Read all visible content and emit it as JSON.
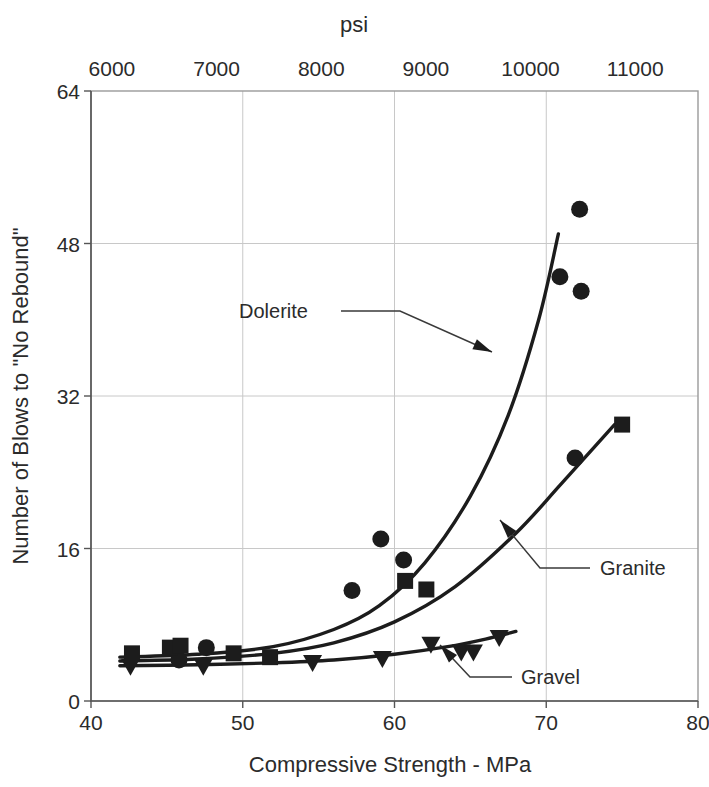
{
  "chart_data": {
    "type": "scatter",
    "title": "",
    "xlabel": "Compressive Strength - MPa",
    "ylabel": "Number of Blows to \"No Rebound\"",
    "top_axis_label": "psi",
    "xlim": [
      40,
      80
    ],
    "ylim": [
      0,
      64
    ],
    "top_xlim": [
      5800,
      11600
    ],
    "xticks": [
      40,
      50,
      60,
      70,
      80
    ],
    "xticklabels": [
      "40",
      "50",
      "60",
      "70",
      "80"
    ],
    "yticks": [
      0,
      16,
      32,
      48,
      64
    ],
    "yticklabels": [
      "0",
      "16",
      "32",
      "48",
      "64"
    ],
    "top_xticks": [
      6000,
      7000,
      8000,
      9000,
      10000,
      11000
    ],
    "top_xticklabels": [
      "6000",
      "7000",
      "8000",
      "9000",
      "10000",
      "11000"
    ],
    "grid": true,
    "legend_position": "inline-annotations",
    "series": [
      {
        "name": "Dolerite",
        "marker": "circle",
        "color": "#1c1c1c",
        "points": [
          {
            "x": 47.6,
            "y": 5.6
          },
          {
            "x": 45.8,
            "y": 4.3
          },
          {
            "x": 59.1,
            "y": 17.0
          },
          {
            "x": 57.2,
            "y": 11.6
          },
          {
            "x": 60.6,
            "y": 14.8
          },
          {
            "x": 70.9,
            "y": 44.5
          },
          {
            "x": 72.2,
            "y": 51.6
          },
          {
            "x": 72.3,
            "y": 43.0
          },
          {
            "x": 71.9,
            "y": 25.5
          }
        ]
      },
      {
        "name": "Granite",
        "marker": "square",
        "color": "#1c1c1c",
        "points": [
          {
            "x": 42.7,
            "y": 5.0
          },
          {
            "x": 45.2,
            "y": 5.6
          },
          {
            "x": 45.9,
            "y": 5.8
          },
          {
            "x": 49.4,
            "y": 5.0
          },
          {
            "x": 51.8,
            "y": 4.6
          },
          {
            "x": 60.7,
            "y": 12.6
          },
          {
            "x": 62.1,
            "y": 11.7
          },
          {
            "x": 75.0,
            "y": 29.0
          }
        ]
      },
      {
        "name": "Gravel",
        "marker": "triangle-down",
        "color": "#1c1c1c",
        "points": [
          {
            "x": 42.6,
            "y": 3.6
          },
          {
            "x": 47.4,
            "y": 3.6
          },
          {
            "x": 54.6,
            "y": 4.0
          },
          {
            "x": 59.2,
            "y": 4.4
          },
          {
            "x": 62.4,
            "y": 5.9
          },
          {
            "x": 64.4,
            "y": 5.1
          },
          {
            "x": 65.2,
            "y": 5.1
          },
          {
            "x": 66.9,
            "y": 6.6
          }
        ]
      }
    ],
    "trend_curves": [
      {
        "name": "Dolerite",
        "points": [
          [
            41.9,
            4.6
          ],
          [
            47.0,
            4.9
          ],
          [
            52.0,
            5.7
          ],
          [
            56.0,
            7.5
          ],
          [
            59.0,
            10.0
          ],
          [
            62.0,
            14.5
          ],
          [
            65.0,
            21.5
          ],
          [
            67.5,
            30.0
          ],
          [
            69.5,
            40.0
          ],
          [
            70.8,
            49.0
          ]
        ]
      },
      {
        "name": "Granite",
        "points": [
          [
            41.9,
            4.2
          ],
          [
            47.0,
            4.4
          ],
          [
            52.0,
            5.0
          ],
          [
            56.0,
            6.1
          ],
          [
            60.0,
            8.3
          ],
          [
            64.0,
            12.0
          ],
          [
            68.0,
            17.6
          ],
          [
            71.0,
            22.8
          ],
          [
            74.5,
            29.0
          ]
        ]
      },
      {
        "name": "Gravel",
        "points": [
          [
            41.9,
            3.7
          ],
          [
            47.0,
            3.8
          ],
          [
            52.0,
            4.0
          ],
          [
            56.0,
            4.3
          ],
          [
            60.0,
            4.9
          ],
          [
            63.5,
            5.7
          ],
          [
            66.0,
            6.5
          ],
          [
            68.0,
            7.3
          ]
        ]
      }
    ],
    "annotations": [
      {
        "label": "Dolerite",
        "target": {
          "x": 66.4,
          "y": 26.5
        }
      },
      {
        "label": "Granite",
        "target": {
          "x": 68.4,
          "y": 18.6
        }
      },
      {
        "label": "Gravel",
        "target": {
          "x": 62.3,
          "y": 5.2
        }
      }
    ]
  }
}
